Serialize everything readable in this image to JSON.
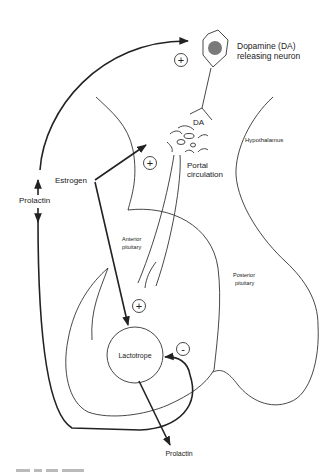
{
  "diagram": {
    "type": "physiology-feedback-loop",
    "labels": {
      "neuron": [
        "Dopamine (DA)",
        "releasing neuron"
      ],
      "da": "DA",
      "hypothalamus": "Hypothalamus",
      "portal": [
        "Portal",
        "circulation"
      ],
      "estrogen": "Estrogen",
      "prolactin_left": "Prolactin",
      "anterior": [
        "Anterior",
        "pituitary"
      ],
      "posterior": [
        "Posterior",
        "pituitary"
      ],
      "lactotrope": "Lactotrope",
      "prolactin_bottom": "Prolactin"
    },
    "signs": {
      "top_plus": "+",
      "estrogen_plus": "+",
      "lactotrope_plus": "+",
      "feedback_minus": "-"
    },
    "caption": "Fig. ..."
  }
}
